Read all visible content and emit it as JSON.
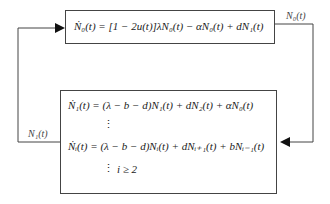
{
  "diagram": {
    "top_box": {
      "equation": "Ṅ₀(t) = [1 − 2u(t)]λN₀(t) − αN₀(t) + dN₁(t)"
    },
    "bottom_box": {
      "equation_1": "Ṅ₁(t) = (λ − b − d)N₁(t) + dN₂(t) + αN₀(t)",
      "dots_1": "⋮",
      "equation_i": "Ṅᵢ(t) = (λ − b − d)Nᵢ(t) + dNᵢ₊₁(t) + bNᵢ₋₁(t)",
      "dots_2": "⋮",
      "condition": "i ≥ 2"
    },
    "edges": {
      "right_label": "N₀(t)",
      "left_label": "N₁(t)"
    },
    "colors": {
      "line": "#444444",
      "text": "#222222"
    }
  }
}
